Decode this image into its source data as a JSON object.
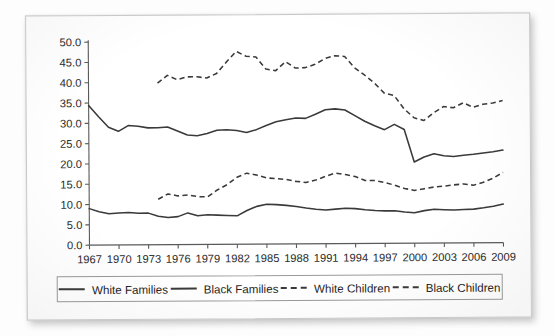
{
  "chart_data": {
    "type": "line",
    "title": "",
    "xlabel": "",
    "ylabel": "",
    "xlim": [
      1967,
      2009
    ],
    "ylim": [
      0.0,
      50.0
    ],
    "ytick_labels": [
      "0.0",
      "5.0",
      "10.0",
      "15.0",
      "20.0",
      "25.0",
      "30.0",
      "35.0",
      "40.0",
      "45.0",
      "50.0"
    ],
    "ytick_values": [
      0,
      5,
      10,
      15,
      20,
      25,
      30,
      35,
      40,
      45,
      50
    ],
    "xtick_labels": [
      "1967",
      "1970",
      "1973",
      "1976",
      "1979",
      "1982",
      "1985",
      "1988",
      "1991",
      "1994",
      "1997",
      "2000",
      "2003",
      "2006",
      "2009"
    ],
    "xtick_values": [
      1967,
      1970,
      1973,
      1976,
      1979,
      1982,
      1985,
      1988,
      1991,
      1994,
      1997,
      2000,
      2003,
      2006,
      2009
    ],
    "grid": false,
    "legend_position": "bottom",
    "series": [
      {
        "name": "White Families",
        "style": "solid",
        "color": "#3a3a3a",
        "x": [
          1967,
          1968,
          1969,
          1970,
          1971,
          1972,
          1973,
          1974,
          1975,
          1976,
          1977,
          1978,
          1979,
          1980,
          1981,
          1982,
          1983,
          1984,
          1985,
          1986,
          1987,
          1988,
          1989,
          1990,
          1991,
          1992,
          1993,
          1994,
          1995,
          1996,
          1997,
          1998,
          1999,
          2000,
          2001,
          2002,
          2003,
          2004,
          2005,
          2006,
          2007,
          2008,
          2009
        ],
        "y": [
          34.4,
          31.6,
          29.0,
          28.0,
          29.4,
          29.2,
          28.8,
          28.8,
          29.0,
          28.0,
          27.0,
          26.8,
          27.3,
          28.1,
          28.2,
          28.0,
          27.5,
          28.2,
          29.2,
          30.1,
          30.6,
          31.0,
          30.9,
          31.9,
          33.0,
          33.2,
          32.9,
          31.5,
          30.1,
          29.0,
          28.0,
          29.3,
          28.0,
          20.0,
          21.2,
          22.0,
          21.5,
          21.3,
          21.6,
          21.8,
          22.1,
          22.4,
          22.8
        ]
      },
      {
        "name": "Black Families",
        "style": "solid",
        "color": "#3a3a3a",
        "x": [
          1967,
          1968,
          1969,
          1970,
          1971,
          1972,
          1973,
          1974,
          1975,
          1976,
          1977,
          1978,
          1979,
          1980,
          1981,
          1982,
          1983,
          1984,
          1985,
          1986,
          1987,
          1988,
          1989,
          1990,
          1991,
          1992,
          1993,
          1994,
          1995,
          1996,
          1997,
          1998,
          1999,
          2000,
          2001,
          2002,
          2003,
          2004,
          2005,
          2006,
          2007,
          2008,
          2009
        ],
        "y": [
          9.0,
          8.2,
          7.7,
          7.9,
          8.0,
          7.8,
          7.8,
          7.0,
          6.7,
          6.9,
          7.8,
          7.1,
          7.3,
          7.2,
          7.1,
          7.0,
          8.3,
          9.3,
          9.8,
          9.7,
          9.5,
          9.2,
          8.8,
          8.5,
          8.3,
          8.5,
          8.7,
          8.6,
          8.3,
          8.1,
          8.0,
          8.0,
          7.7,
          7.5,
          8.0,
          8.3,
          8.2,
          8.1,
          8.2,
          8.3,
          8.6,
          9.0,
          9.5
        ]
      },
      {
        "name": "White Children",
        "style": "dashed",
        "color": "#3a3a3a",
        "x": [
          1974,
          1975,
          1976,
          1977,
          1978,
          1979,
          1980,
          1981,
          1982,
          1983,
          1984,
          1985,
          1986,
          1987,
          1988,
          1989,
          1990,
          1991,
          1992,
          1993,
          1994,
          1995,
          1996,
          1997,
          1998,
          1999,
          2000,
          2001,
          2002,
          2003,
          2004,
          2005,
          2006,
          2007,
          2008,
          2009
        ],
        "y": [
          11.2,
          12.5,
          12.0,
          12.2,
          11.8,
          11.7,
          13.4,
          14.7,
          16.5,
          17.5,
          17.0,
          16.3,
          16.1,
          15.9,
          15.4,
          15.1,
          15.7,
          16.6,
          17.4,
          17.0,
          16.5,
          15.5,
          15.5,
          15.0,
          14.3,
          13.5,
          13.0,
          13.4,
          13.8,
          14.0,
          14.3,
          14.5,
          14.2,
          14.9,
          15.9,
          17.3
        ]
      },
      {
        "name": "Black Children",
        "style": "dashed",
        "color": "#3a3a3a",
        "x": [
          1974,
          1975,
          1976,
          1977,
          1978,
          1979,
          1980,
          1981,
          1982,
          1983,
          1984,
          1985,
          1986,
          1987,
          1988,
          1989,
          1990,
          1991,
          1992,
          1993,
          1994,
          1995,
          1996,
          1997,
          1998,
          1999,
          2000,
          2001,
          2002,
          2003,
          2004,
          2005,
          2006,
          2007,
          2008,
          2009
        ],
        "y": [
          39.8,
          41.7,
          40.6,
          41.3,
          41.3,
          41.0,
          42.1,
          44.9,
          47.5,
          46.3,
          46.1,
          43.1,
          42.7,
          44.9,
          43.3,
          43.4,
          44.2,
          45.6,
          46.3,
          46.1,
          43.3,
          41.5,
          39.5,
          37.0,
          36.4,
          33.1,
          30.9,
          30.2,
          32.1,
          33.6,
          33.3,
          34.5,
          33.4,
          34.1,
          34.4,
          35.0
        ]
      }
    ]
  },
  "legend": {
    "items": [
      {
        "label": "White Families",
        "style": "solid"
      },
      {
        "label": "Black Families",
        "style": "solid"
      },
      {
        "label": "White Children",
        "style": "dashed"
      },
      {
        "label": "Black Children",
        "style": "dashed"
      }
    ]
  }
}
